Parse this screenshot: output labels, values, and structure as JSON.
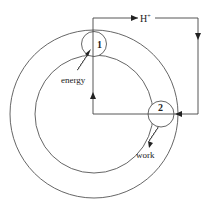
{
  "diagram": {
    "type": "proton-circuit",
    "labels": {
      "site1": "1",
      "site2": "2",
      "proton": "H",
      "proton_charge": "+",
      "energy": "energy",
      "work": "work"
    },
    "colors": {
      "stroke": "#555555",
      "text": "#222222",
      "background": "#ffffff"
    }
  }
}
